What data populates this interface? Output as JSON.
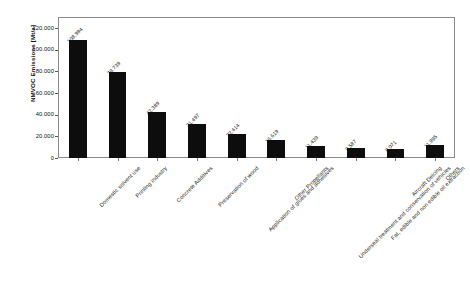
{
  "chart_data": {
    "type": "bar",
    "title": "",
    "xlabel": "",
    "ylabel": "NMVOC Emissions [Mt/a]",
    "ylim": [
      0,
      130000
    ],
    "grid": false,
    "legend": "none",
    "y_tick_labels": [
      "120.000",
      "100.000",
      "80.000",
      "60.000",
      "40.000",
      "20.000",
      "0"
    ],
    "y_tick_values": [
      120000,
      100000,
      80000,
      60000,
      40000,
      20000,
      0
    ],
    "categories": [
      "Domestic solvent use",
      "Printing industry",
      "Concrete Additives",
      "Preservation of wood",
      "Application of glues and adhesives",
      "Other Propellants",
      "Underseal treatment and conservation of vehicles",
      "Fat, edible and non edible oil extraction",
      "Aircraft Deicing",
      "Others"
    ],
    "values": [
      108994,
      79739,
      42389,
      31497,
      22414,
      16619,
      11439,
      9587,
      8071,
      11995
    ],
    "value_labels": [
      "108.994",
      "79.739",
      "42.389",
      "31.497",
      "22.414",
      "16.619",
      "11.439",
      "9.587",
      "8.071",
      "11.995"
    ],
    "bar_color": "#0d0d0d",
    "frame_color": "#8a8a8a",
    "background_color": "#ffffff"
  }
}
